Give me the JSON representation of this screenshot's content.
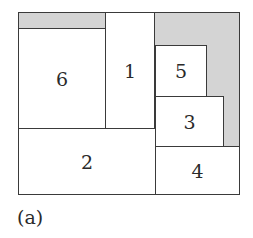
{
  "figure": {
    "caption": "(a)",
    "outer_box": {
      "x": 18,
      "y": 12,
      "w": 222,
      "h": 183
    },
    "colors": {
      "border": "#3a3a3a",
      "waste_fill": "#d4d4d4",
      "piece_fill": "#ffffff",
      "text": "#2a2a2a"
    },
    "waste_regions": [
      {
        "name": "waste-top-left",
        "x": 18,
        "y": 12,
        "w": 87,
        "h": 17
      },
      {
        "name": "waste-right",
        "x": 155,
        "y": 12,
        "w": 85,
        "h": 134
      }
    ],
    "pieces": [
      {
        "label": "1",
        "x": 105,
        "y": 12,
        "w": 50,
        "h": 116
      },
      {
        "label": "2",
        "x": 18,
        "y": 128,
        "w": 137,
        "h": 67
      },
      {
        "label": "3",
        "x": 155,
        "y": 96,
        "w": 68,
        "h": 50
      },
      {
        "label": "4",
        "x": 155,
        "y": 146,
        "w": 85,
        "h": 49
      },
      {
        "label": "5",
        "x": 155,
        "y": 45,
        "w": 51,
        "h": 51
      },
      {
        "label": "6",
        "x": 18,
        "y": 29,
        "w": 87,
        "h": 99
      }
    ]
  }
}
